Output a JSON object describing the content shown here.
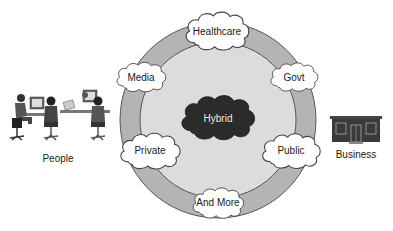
{
  "diagram": {
    "center": {
      "label": "Hybrid"
    },
    "clouds": [
      {
        "id": "healthcare",
        "label": "Healthcare"
      },
      {
        "id": "media",
        "label": "Media"
      },
      {
        "id": "govt",
        "label": "Govt"
      },
      {
        "id": "private",
        "label": "Private"
      },
      {
        "id": "public",
        "label": "Public"
      },
      {
        "id": "and-more",
        "label": "And More"
      }
    ],
    "left_entity": {
      "label": "People",
      "icon": "people-at-computers-icon"
    },
    "right_entity": {
      "label": "Business",
      "icon": "building-storefront-icon"
    },
    "colors": {
      "outer_ring": "#b4b4b4",
      "inner_circle": "#dcdcdc",
      "hybrid_cloud": "#2b2b2b",
      "cloud_fill": "#ffffff",
      "stroke": "#444444"
    }
  }
}
